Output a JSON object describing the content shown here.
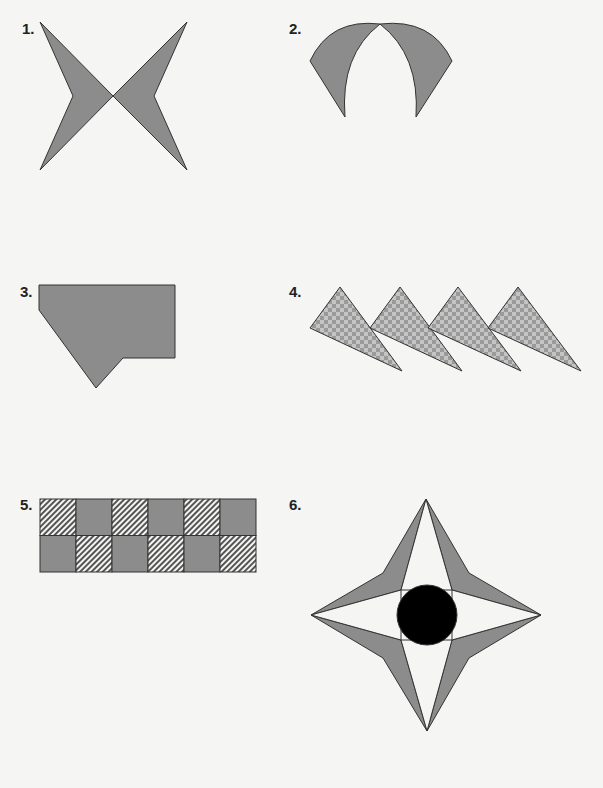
{
  "worksheet": {
    "figures": [
      {
        "number": "1.",
        "description": "Two mirrored arrowhead shapes crossing at a point (bow-tie X)",
        "fill": "#8c8c8c"
      },
      {
        "number": "2.",
        "description": "Two curved crescent wedges meeting at a top point forming an arch",
        "fill": "#8c8c8c"
      },
      {
        "number": "3.",
        "description": "Irregular polygon with a notch and downward point",
        "fill": "#8c8c8c"
      },
      {
        "number": "4.",
        "description": "Four overlapping checkered triangles in a row",
        "fill": "#8c8c8c",
        "pattern": "checkerboard"
      },
      {
        "number": "5.",
        "description": "2x6 grid of alternating solid and hatched squares",
        "fill": "#8c8c8c",
        "pattern": "diagonal-hatch",
        "rows": 2,
        "columns": 6
      },
      {
        "number": "6.",
        "description": "Four-pointed star with shaded kite wings and a black center circle",
        "fill": "#8c8c8c",
        "center_fill": "#000000"
      }
    ]
  }
}
